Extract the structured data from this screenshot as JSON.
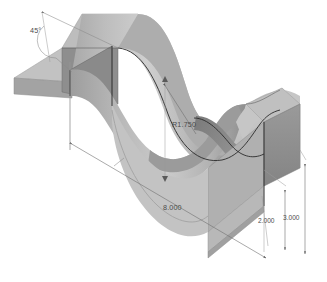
{
  "drawing": {
    "title": "Isometric wave block technical drawing",
    "background_color": "#ffffff",
    "view": "isometric",
    "object_description": "Corrugated / wavy rectangular block with two sinusoidal valleys and flat end flanges"
  },
  "dimensions": [
    {
      "id": "angle-45",
      "label": "45°",
      "type": "angular",
      "value": "45",
      "unit": "degrees",
      "position": {
        "x": 30,
        "y": 33
      }
    },
    {
      "id": "radius-r1750",
      "label": "R1.750",
      "type": "radial",
      "value": "1.750",
      "prefix": "R",
      "position": {
        "x": 172,
        "y": 127
      }
    },
    {
      "id": "length-8000",
      "label": "8.000",
      "type": "linear",
      "value": "8.000",
      "position": {
        "x": 163,
        "y": 210
      }
    },
    {
      "id": "height-2000",
      "label": "2.000",
      "type": "linear",
      "value": "2.000",
      "position": {
        "x": 272,
        "y": 223
      }
    },
    {
      "id": "height-3000",
      "label": "3.000",
      "type": "linear",
      "value": "3.000",
      "position": {
        "x": 290,
        "y": 220
      }
    }
  ],
  "colors": {
    "face_light": "#c9c9c9",
    "face_mid": "#b4b4b4",
    "face_dark": "#8f8f8f",
    "face_darker": "#7d7d7d",
    "face_shadow": "#9e9e9e",
    "face_highlight": "#d6d6d6",
    "edge": "#2b2b2b",
    "dimension_line": "#707070",
    "text": "#4a4a4a",
    "background": "#ffffff"
  },
  "geometry": {
    "left_flange": "flat angled plate at left end",
    "right_flange": "flat angled plate at right end",
    "wave_count": 2,
    "surface_type": "sinusoidal extruded"
  }
}
